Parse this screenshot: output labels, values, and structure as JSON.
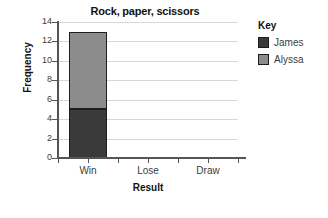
{
  "chart_data": {
    "type": "bar",
    "subtype": "stacked-bar",
    "title": "Rock, paper, scissors",
    "xlabel": "Result",
    "ylabel": "Frequency",
    "categories": [
      "Win",
      "Lose",
      "Draw"
    ],
    "series": [
      {
        "name": "James",
        "values": [
          5,
          0,
          0
        ],
        "color": "#3a3a3a"
      },
      {
        "name": "Alyssa",
        "values": [
          8,
          0,
          0
        ],
        "color": "#8c8c8c"
      }
    ],
    "totals": [
      13,
      0,
      0
    ],
    "ylim": [
      0,
      14
    ],
    "ytick_values": [
      0,
      2,
      4,
      6,
      8,
      10,
      12,
      14
    ],
    "ytick_labels": [
      "0",
      "2",
      "4",
      "6",
      "8",
      "10",
      "12",
      "14"
    ],
    "grid": {
      "horizontal": true,
      "vertical": false,
      "color": "#d8d8d8"
    },
    "legend": {
      "title": "Key",
      "position": "right",
      "entries": [
        {
          "label": "James",
          "color": "#3a3a3a"
        },
        {
          "label": "Alyssa",
          "color": "#8c8c8c"
        }
      ]
    },
    "background": "#ffffff",
    "axis_color": "#555555"
  }
}
